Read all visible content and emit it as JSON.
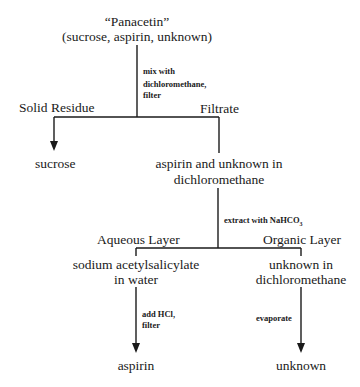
{
  "diagram": {
    "type": "separation-flowchart",
    "start": {
      "title": "“Panacetin”",
      "subtitle": "(sucrose, aspirin, unknown)"
    },
    "step1": {
      "reagent_lines": [
        "mix with",
        "dichloromethane,",
        "filter"
      ],
      "left_branch_label": "Solid Residue",
      "right_branch_label": "Filtrate",
      "left_product": "sucrose",
      "right_product_lines": [
        "aspirin and unknown in",
        "dichloromethane"
      ]
    },
    "step2": {
      "reagent": "extract with NaHCO",
      "reagent_subscript": "3",
      "left_branch_label": "Aqueous Layer",
      "right_branch_label": "Organic Layer",
      "left_product_lines": [
        "sodium acetylsalicylate",
        "in water"
      ],
      "right_product_lines": [
        "unknown in",
        "dichloromethane"
      ]
    },
    "step3_left": {
      "reagent_lines": [
        "add HCl,",
        "filter"
      ],
      "product": "aspirin"
    },
    "step3_right": {
      "reagent": "evaporate",
      "product": "unknown"
    },
    "colors": {
      "line": "#1a1a1a",
      "background": "#ffffff"
    }
  }
}
